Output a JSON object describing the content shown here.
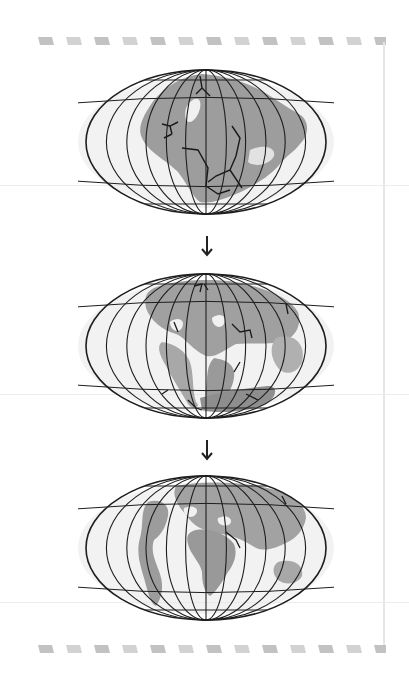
{
  "figure": {
    "stages": [
      {
        "id": "stage-1",
        "label": "Pangaea supercontinent"
      },
      {
        "id": "stage-2",
        "label": "Continents breaking apart"
      },
      {
        "id": "stage-3",
        "label": "Present-day continents"
      }
    ],
    "arrows": [
      "down-arrow",
      "down-arrow"
    ],
    "colors": {
      "land": "#9a9a9a",
      "land_light": "#c4c4c4",
      "ocean_haze": "#e4e4e4",
      "grid": "#1e1e1e",
      "stripe": "#c8c8c8"
    }
  }
}
